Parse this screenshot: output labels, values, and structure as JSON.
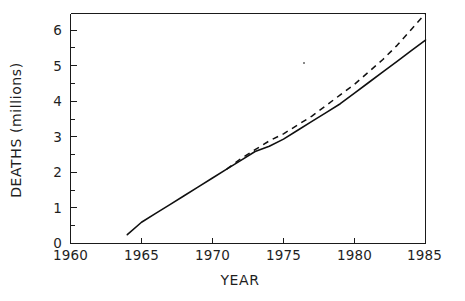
{
  "chart_data": {
    "type": "line",
    "title": "",
    "xlabel": "YEAR",
    "ylabel": "DEATHS (millions)",
    "xlim": [
      1960,
      1985
    ],
    "ylim": [
      0,
      6.5
    ],
    "grid": false,
    "legend": "none",
    "xticks": [
      1960,
      1965,
      1970,
      1975,
      1980,
      1985
    ],
    "xtick_labels": [
      "1960",
      "1965",
      "1970",
      "1975",
      "1980",
      "1985"
    ],
    "yticks": [
      0,
      1,
      2,
      3,
      4,
      5,
      6
    ],
    "ytick_labels": [
      "0",
      "1",
      "2",
      "3",
      "4",
      "5",
      "6"
    ],
    "x_minor_tick_interval": 1,
    "y_minor_tick_interval": 0.5,
    "series": [
      {
        "name": "observed",
        "style": "solid",
        "x": [
          1964,
          1965,
          1966,
          1967,
          1968,
          1969,
          1970,
          1971,
          1972,
          1973,
          1974,
          1975,
          1976,
          1977,
          1978,
          1979,
          1980,
          1981,
          1982,
          1983,
          1984,
          1985
        ],
        "values": [
          0.25,
          0.6,
          0.85,
          1.1,
          1.35,
          1.6,
          1.85,
          2.1,
          2.35,
          2.6,
          2.75,
          2.95,
          3.2,
          3.45,
          3.7,
          3.95,
          4.25,
          4.55,
          4.85,
          5.15,
          5.45,
          5.75
        ]
      },
      {
        "name": "projected",
        "style": "dashed",
        "x": [
          1971,
          1972,
          1973,
          1974,
          1975,
          1976,
          1977,
          1978,
          1979,
          1980,
          1981,
          1982,
          1983,
          1984,
          1985
        ],
        "values": [
          2.1,
          2.4,
          2.65,
          2.9,
          3.1,
          3.35,
          3.6,
          3.9,
          4.2,
          4.5,
          4.85,
          5.2,
          5.6,
          6.05,
          6.5
        ]
      }
    ]
  },
  "axes": {
    "x_title": "YEAR",
    "y_title": "DEATHS (millions)"
  }
}
